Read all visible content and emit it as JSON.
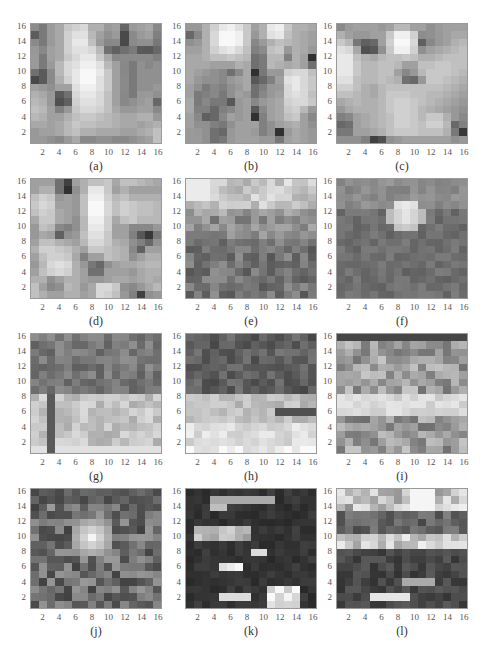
{
  "figure": {
    "panels": [
      {
        "label": "(a)",
        "left": 30,
        "top": 23
      },
      {
        "label": "(b)",
        "left": 185,
        "top": 23
      },
      {
        "label": "(c)",
        "left": 336,
        "top": 23
      },
      {
        "label": "(d)",
        "left": 30,
        "top": 178
      },
      {
        "label": "(e)",
        "left": 185,
        "top": 178
      },
      {
        "label": "(f)",
        "left": 336,
        "top": 178
      },
      {
        "label": "(g)",
        "left": 30,
        "top": 333
      },
      {
        "label": "(h)",
        "left": 185,
        "top": 333
      },
      {
        "label": "(i)",
        "left": 336,
        "top": 333
      },
      {
        "label": "(j)",
        "left": 30,
        "top": 488
      },
      {
        "label": "(k)",
        "left": 185,
        "top": 488
      },
      {
        "label": "(l)",
        "left": 336,
        "top": 488
      }
    ]
  },
  "chart_data": {
    "type": "heatmap",
    "title": "",
    "layout": "4x3 grid of grayscale 16x16 heatmaps",
    "xlabel": "",
    "ylabel": "",
    "x_ticks": [
      2,
      4,
      6,
      8,
      10,
      12,
      14,
      16
    ],
    "y_ticks": [
      2,
      4,
      6,
      8,
      10,
      12,
      14,
      16
    ],
    "xlim": [
      0.5,
      16.5
    ],
    "ylim": [
      0.5,
      16.5
    ],
    "colormap": "gray",
    "grid": false,
    "legend": null,
    "panels": [
      {
        "label": "(a)",
        "rows_top_to_bottom": [
          "8c7a9aa8c8d0d8b0b09aa0669aa0a888",
          "5c7a9aa8d0e0e0b8a0909a4a8a9aa080",
          "8a7a9aa8d0e8e8c09a88884a8a909078",
          "9888a0a8d0e0e0d8b87060707a5a5868",
          "9a7aa0a8c8d8e8e8c8a8888a8a8a8a80",
          "9a7a9ab8d8e0f0f0e0b8a0887a908890",
          "705a8ab8d8e8f8f8e8c8a0887a909090",
          "485a8ab0d0e8f8f8e0c8a08a7a909090",
          "a09890a0a0e0f0f0e0c8a08a7a909098",
          "b0a8985a70d8e8e8d8c0a0887a989a90",
          "b8b0985060d0e0e0d8c0a088909aa068",
          "c0b8a08098c8d8d8d0c0a89898a0a088",
          "b8b0a0a0b0c0c8c8c0b8b0a8a8b0b098",
          "a8a8a0a8b8c8c0c0b8b8b0a8a8a0a8b0",
          "98a0a0a8b8c0b0b0a8a8a8a0a0a8b0c0",
          "9898908898a88888909088889098a0c0"
        ]
      },
      {
        "label": "(b)",
        "rows_top_to_bottom": [
          "9898b0d0e8f0e0c8a0b0e8f0c8b0b0a8",
          "6888b0d8f8f8f0c898b0e0e8c0b0a8a0",
          "9098b0d8f8f8f0c8889ab0c0b8b0a8a0",
          "a0a0b0d0e0e8d8c0808ac0c898b0a898",
          "a8a8b0c0c0c8c0b8707ab8b880b0a030",
          "a8a8a8a0a0a0b0a8707ab8b0a8b0a070",
          "a8a0989088708aa830789a98d0d8d8c0",
          "a89890908898a0a8586880a0e0e8d8c8",
          "a0907a8880909aa87080989ad8e8d8c8",
          "a07a80887890a098708898a0d8e0d8c0",
          "a87a8878785898a08898a0a8d0d8d8c8",
          "a8808068808898a05888a0a8c8d0b898",
          "a088606888a098a03080a0a8c0c8a088",
          "a09090807890a0a0a08090a0a8b0a090",
          "9a9890706898a0a09a8090309aa8a098",
          "9a9a90707898a0a0a0989878a0a8a098"
        ]
      },
      {
        "label": "(c)",
        "rows_top_to_bottom": [
          "8a9aa0a0a098a0b8b8a0a0909aa0a0a0",
          "b0a09898a0a0c8f0f0d08c9098a0a8a8",
          "c8b8786068a0d0f8f8d8608898a0b0b8",
          "e0d8a8505890c8f0f0d090a0a8b0b8c0",
          "e8e8c0b0a8b8c0c0c8c0b0b0b8c0c0c0",
          "e8e8c8b8b8c0c0b8a0a0c0c0c8c8c0c0",
          "e8e8c8b8b8c0c0a08898b8c8c8c8c0b8",
          "e0e0c0b8b8c0b8b0706898c8c8c0b8b0",
          "d0d0c0b0a8b8c0c0c0c0c0c0c0b8b0a8",
          "c0c0b8b0a8b8c8c8c8c0c0b8b8b0a8a0",
          "a8b0b8b0b0b8c8d0d0c8c0b8b0a8a098",
          "98a8b0b0b0b8c8d0d0c8b8b0a8a09890",
          "8088a0a8b0b8c0d0d0c8b8c8c8b09888",
          "6870a0a8b0b8c0d0d0c8c0d0d0b86880",
          "7878a0a0a8b0c0c8c8c8c0c0c0b07838",
          "9090908040509098a0a0a0a0a0a09098"
        ]
      },
      {
        "label": "(d)",
        "rows_top_to_bottom": [
          "a0a0a07040a0b0c0c0c8a8c0c0b8b0a8",
          "a0b0b0703090b0e8e8c8a0b0a0a0a0a0",
          "c0d0c898a098c0f0f0d0b8c0b0b0b0b0",
          "c8d8d0a0a098c0f8f8d8c0d0c8c0c0b8",
          "c0d0c8a8a098c0f8f8d8c0d0c8c0c0b8",
          "a8c8c8a8a090b8f0f0d0a8c0c8b8b8b8",
          "98c0b8888090b8e8e8d0a0a08888889898",
          "98a8a0609098c0e0e0c8a0a080583878",
          "a0c0c0b0a8a0b8d8d8c8b0a890806890",
          "b0d0d0c8c0b0a0c8c8c0b8b08860a0a0",
          "a0c0d0d0c8a880a0a0c0b8b090a0b0b0",
          "98b8d8e0d8b098786890a0a8a8b0b8b8",
          "a0c0d0d8d0b0a07070a0a0a098a8b0b0",
          "b0b090a0b0b0a09898a0a8a8a0a8b0a8",
          "c0a08890b8b098a8d8d8c8908898a8b8",
          "c0b0a0a0b0b0a0a8d8d0c09880409098"
        ]
      }
    ],
    "note": "Panels (e)-(l) also 16x16 grayscale heatmaps; approximate grids in render script."
  }
}
